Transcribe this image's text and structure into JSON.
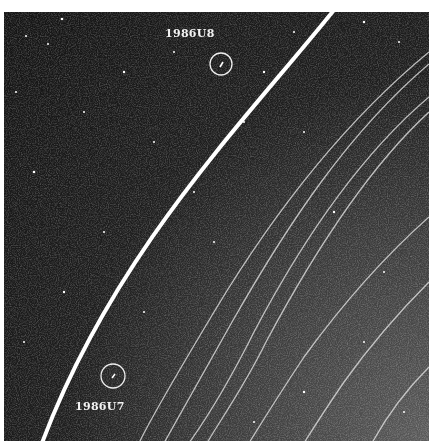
{
  "image": {
    "subject": "Planetary ring arcs with two circled small moons on a star-speckled dark background",
    "background_color": "#1a1a1a",
    "ring_color": "#ffffff"
  },
  "annotations": [
    {
      "id": "moon-u8",
      "label": "1986U8",
      "label_pos": [
        165,
        27
      ],
      "circle_center": [
        221,
        63
      ],
      "circle_radius": 11
    },
    {
      "id": "moon-u7",
      "label": "1986U7",
      "label_pos": [
        75,
        400
      ],
      "circle_center": [
        113,
        376
      ],
      "circle_radius": 12
    }
  ]
}
